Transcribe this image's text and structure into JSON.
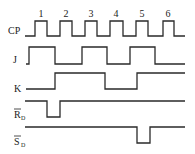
{
  "diagram": {
    "type": "timing-diagram",
    "clock_pulse_numbers": [
      "1",
      "2",
      "3",
      "4",
      "5",
      "6"
    ],
    "signals": [
      {
        "name": "CP",
        "label": "CP",
        "label_sub": "",
        "overline": false,
        "points": "25,36 35,36 35,21 47,21 47,36 60,36 60,21 72,21 72,36 85,36 85,21 97,21 97,36 110,36 110,21 123,21 123,36 136,36 136,21 148,21 148,36 163,36 163,21 174,21 174,36 185,36",
        "label_x": 8,
        "label_y": 34
      },
      {
        "name": "J",
        "label": "J",
        "label_sub": "",
        "overline": false,
        "points": "26,64 29,64 29,47 55,47 55,64 82,64 82,47 107,47 107,64 130,64 130,47 155,47 155,64 185,64",
        "label_x": 13,
        "label_y": 63
      },
      {
        "name": "K",
        "label": "K",
        "label_sub": "",
        "overline": false,
        "points": "26,89 55,89 55,73 105,73 105,89 137,89 137,73 185,73",
        "label_x": 14,
        "label_y": 92
      },
      {
        "name": "RD",
        "label": "R",
        "label_sub": "D",
        "overline": true,
        "points": "25,101 47,101 47,117 60,117 60,101 185,101",
        "label_x": 14,
        "label_y": 118
      },
      {
        "name": "SD",
        "label": "S",
        "label_sub": "D",
        "overline": true,
        "points": "25,127 137,127 137,143 150,143 150,127 185,127",
        "label_x": 14,
        "label_y": 145
      }
    ],
    "pulse_number_positions": [
      41,
      66,
      91,
      116,
      142,
      168
    ],
    "pulse_number_y": 17
  }
}
